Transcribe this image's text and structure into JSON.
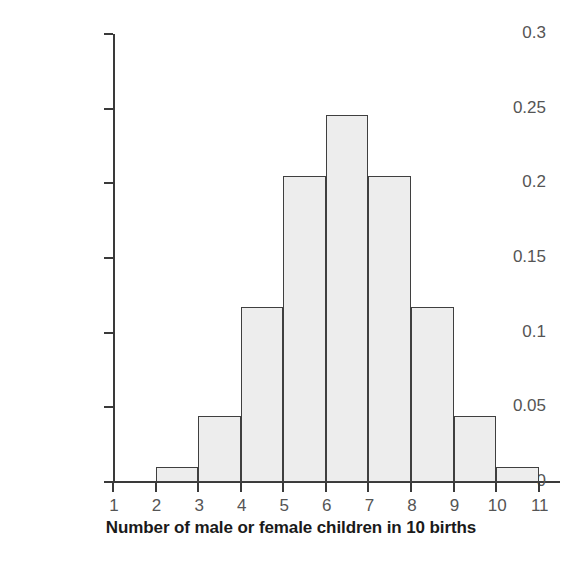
{
  "chart_data": {
    "type": "bar",
    "title": "",
    "subtitle": "",
    "xlabel": "Number of male or female children in 10 births",
    "ylabel": "Probability",
    "categories": [
      "1",
      "2",
      "3",
      "4",
      "5",
      "6",
      "7",
      "8",
      "9"
    ],
    "values": [
      0.0098,
      0.0439,
      0.1172,
      0.2051,
      0.2461,
      0.2051,
      0.1172,
      0.0439,
      0.0098
    ],
    "series": [
      {
        "name": "Probability",
        "values": [
          0.0098,
          0.0439,
          0.1172,
          0.2051,
          0.2461,
          0.2051,
          0.1172,
          0.0439,
          0.0098
        ]
      }
    ],
    "x_tick_labels": [
      "1",
      "2",
      "3",
      "4",
      "5",
      "6",
      "7",
      "8",
      "9",
      "10",
      "11"
    ],
    "y_tick_labels": [
      "0",
      "0.05",
      "0.1",
      "0.15",
      "0.2",
      "0.25",
      "0.3"
    ],
    "y_tick_values": [
      0,
      0.05,
      0.1,
      0.15,
      0.2,
      0.25,
      0.3
    ],
    "ylim": [
      0,
      0.3
    ],
    "xlim": [
      1,
      11
    ],
    "grid": false,
    "legend": false,
    "legend_position": "none",
    "bar_fill_color": "#ededed",
    "bar_edge_color": "#3f3f3f",
    "axis_color": "#3a3a3a",
    "tick_label_color": "#555555",
    "axis_title_color": "#1a1a1a",
    "background_color": "#ffffff",
    "annotations": []
  }
}
